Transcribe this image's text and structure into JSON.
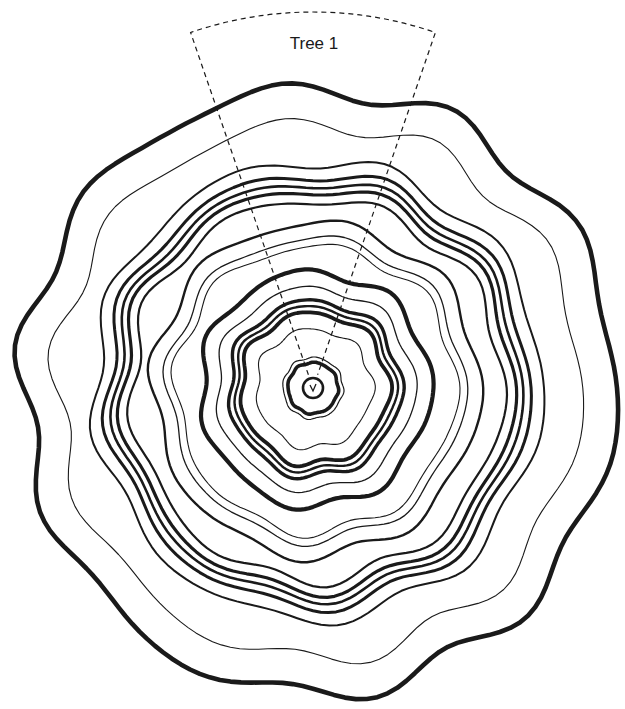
{
  "diagram": {
    "title": "Tree 1",
    "label_pos": {
      "x": 314,
      "y": 44
    },
    "background": "#ffffff",
    "ink": "#1a1a1a",
    "center": {
      "x": 313,
      "y": 388
    },
    "sector": {
      "description": "dashed wedge sector extending from pith to beyond bark",
      "angle_left_deg": -109,
      "angle_right_deg": -71,
      "inner_radius": 14,
      "outer_radius": 376,
      "dash": "5 4",
      "stroke_width": 1.2
    },
    "pith": {
      "radius": 10,
      "stroke_width": 2.6,
      "glyph": "v"
    },
    "rings": [
      {
        "r": 25,
        "w": 3.6,
        "amp": 0.6,
        "lobes": 8,
        "phase": 0.3
      },
      {
        "r": 30,
        "w": 1.2,
        "amp": 0.8,
        "lobes": 8,
        "phase": 0.3
      },
      {
        "r": 58,
        "w": 1.1,
        "amp": 2.5,
        "lobes": 7,
        "phase": 1.1
      },
      {
        "r": 74,
        "w": 3.8,
        "amp": 3.0,
        "lobes": 7,
        "phase": 1.0
      },
      {
        "r": 80,
        "w": 2.4,
        "amp": 3.0,
        "lobes": 7,
        "phase": 1.0
      },
      {
        "r": 86,
        "w": 3.4,
        "amp": 3.2,
        "lobes": 7,
        "phase": 1.0
      },
      {
        "r": 99,
        "w": 1.3,
        "amp": 3.4,
        "lobes": 7,
        "phase": 1.2
      },
      {
        "r": 115,
        "w": 4.2,
        "amp": 4.0,
        "lobes": 7,
        "phase": 1.3
      },
      {
        "r": 140,
        "w": 1.1,
        "amp": 4.5,
        "lobes": 8,
        "phase": 0.7
      },
      {
        "r": 148,
        "w": 1.3,
        "amp": 4.5,
        "lobes": 8,
        "phase": 0.7
      },
      {
        "r": 163,
        "w": 2.4,
        "amp": 5.0,
        "lobes": 8,
        "phase": 0.6
      },
      {
        "r": 186,
        "w": 2.2,
        "amp": 5.5,
        "lobes": 9,
        "phase": 0.4
      },
      {
        "r": 196,
        "w": 3.2,
        "amp": 5.5,
        "lobes": 9,
        "phase": 0.4
      },
      {
        "r": 203,
        "w": 2.6,
        "amp": 5.5,
        "lobes": 9,
        "phase": 0.4
      },
      {
        "r": 211,
        "w": 3.0,
        "amp": 5.8,
        "lobes": 9,
        "phase": 0.4
      },
      {
        "r": 224,
        "w": 2.0,
        "amp": 6.0,
        "lobes": 9,
        "phase": 0.5
      },
      {
        "r": 262,
        "w": 1.1,
        "amp": 7.5,
        "lobes": 10,
        "phase": 0.2
      },
      {
        "r": 296,
        "w": 4.6,
        "amp": 8.0,
        "lobes": 10,
        "phase": 0.1
      }
    ]
  }
}
